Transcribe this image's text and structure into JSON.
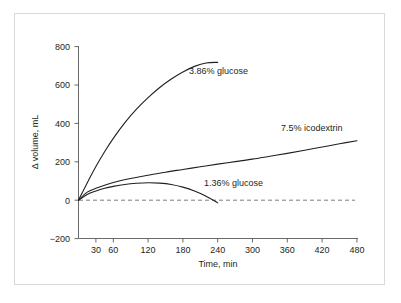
{
  "chart_data": {
    "type": "line",
    "title": "",
    "xlabel": "Time, min",
    "ylabel": "Δ volume, mL",
    "xlim": [
      0,
      480
    ],
    "ylim": [
      -200,
      800
    ],
    "grid": false,
    "legend_position": "inline-annotations",
    "x_ticks": [
      30,
      60,
      120,
      180,
      240,
      300,
      360,
      420,
      480
    ],
    "x_tick_labels": [
      "30",
      "60",
      "120",
      "180",
      "240",
      "300",
      "360",
      "420",
      "480"
    ],
    "y_ticks": [
      -200,
      0,
      200,
      400,
      600,
      800
    ],
    "y_tick_labels": [
      "−200",
      "0",
      "200",
      "400",
      "600",
      "800"
    ],
    "reference_line": {
      "y": 0,
      "style": "dashed",
      "x_start": 0,
      "x_end": 450
    },
    "series": [
      {
        "name": "3.86% glucose",
        "label": "3.86% glucose",
        "x": [
          0,
          15,
          30,
          45,
          60,
          80,
          100,
          120,
          140,
          160,
          180,
          200,
          220,
          240
        ],
        "values": [
          0,
          90,
          175,
          252,
          322,
          404,
          474,
          534,
          587,
          631,
          668,
          697,
          715,
          718
        ]
      },
      {
        "name": "7.5% icodextrin",
        "label": "7.5% icodextrin",
        "x": [
          0,
          15,
          30,
          60,
          90,
          120,
          150,
          180,
          210,
          240,
          270,
          300,
          330,
          360,
          390,
          420,
          450,
          480
        ],
        "values": [
          0,
          42,
          62,
          92,
          113,
          130,
          146,
          160,
          174,
          188,
          201,
          214,
          229,
          244,
          260,
          277,
          294,
          310
        ]
      },
      {
        "name": "1.36% glucose",
        "label": "1.36% glucose",
        "x": [
          0,
          15,
          30,
          45,
          60,
          80,
          100,
          120,
          140,
          160,
          180,
          200,
          220,
          240
        ],
        "values": [
          0,
          30,
          48,
          62,
          72,
          82,
          88,
          91,
          89,
          82,
          68,
          48,
          21,
          -14
        ]
      }
    ],
    "annotations": [
      {
        "text": "3.86% glucose",
        "x_px": 189,
        "y_px": 74
      },
      {
        "text": "7.5% icodextrin",
        "x_px": 281,
        "y_px": 131
      },
      {
        "text": "1.36% glucose",
        "x_px": 204,
        "y_px": 186
      }
    ],
    "colors": {
      "curve": "#231f20",
      "axis": "#58595b",
      "zero_line": "#6d6e71",
      "border": "#d9d9d9",
      "background": "#ffffff"
    }
  }
}
